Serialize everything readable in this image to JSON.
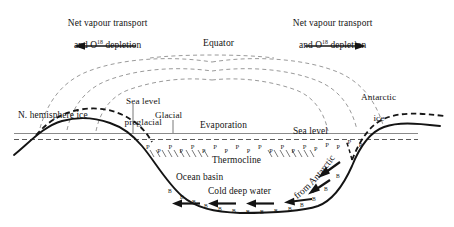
{
  "figure": {
    "title_labels": {
      "net_vapour_left_line1": "Net vapour transport",
      "net_vapour_left_line2_pre": "and O",
      "net_vapour_left_line2_sup": "18",
      "net_vapour_left_line2_post": " depletion",
      "net_vapour_right_line1": "Net vapour transport",
      "net_vapour_right_line2_pre": "and O",
      "net_vapour_right_line2_sup": "18",
      "net_vapour_right_line2_post": " depletion",
      "equator": "Equator",
      "sea_level_preglacial_line1": "Sea level",
      "sea_level_preglacial_line2": "preglacial",
      "glacial": "Glacial",
      "evaporation": "Evaporation",
      "sea_level": "Sea level",
      "n_hemisphere_ice": "N. hemisphere ice",
      "antarctic_ice_line1": "Antarctic",
      "antarctic_ice_line2": "ice",
      "thermocline": "Thermocline",
      "ocean_basin": "Ocean basin",
      "cold_deep_water": "Cold deep water",
      "from_antarctic": "from Antarctic"
    },
    "markers": {
      "thermocline_marker_letter": "P",
      "bottom_water_marker_letter": "B",
      "thermocline_marker_count": 20,
      "bottom_water_marker_count": 14
    },
    "colors": {
      "ink": "#141414",
      "sea_level_line": "#8a8a8a",
      "dashed_ice": "#1a1a1a",
      "vapour_path": "#9a9a9a",
      "background": "#ffffff"
    },
    "arrows": {
      "left_vapour_direction": "left",
      "right_vapour_direction": "right",
      "deep_water_direction": "left",
      "deep_water_arrow_count": 6
    }
  }
}
